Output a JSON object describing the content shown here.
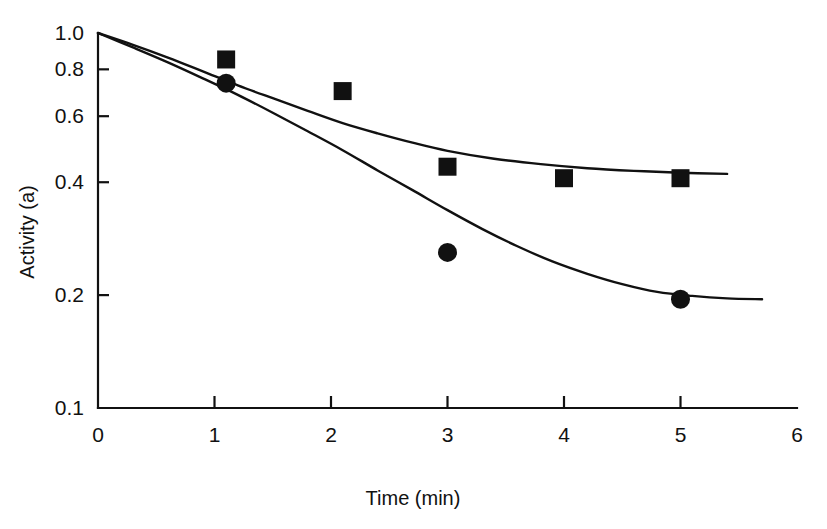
{
  "chart_data": {
    "type": "scatter",
    "title": "",
    "xlabel": "Time (min)",
    "ylabel": "Activity (a)",
    "yscale": "log",
    "xscale": "linear",
    "xlim": [
      0,
      6
    ],
    "ylim": [
      0.1,
      1.0
    ],
    "grid": false,
    "legend": "none",
    "xticks": [
      0,
      1,
      2,
      3,
      4,
      5,
      6
    ],
    "xtick_labels": [
      "0",
      "1",
      "2",
      "3",
      "4",
      "5",
      "6"
    ],
    "yticks": [
      1.0,
      0.8,
      0.6,
      0.4,
      0.2,
      0.1
    ],
    "ytick_labels": [
      "1.0",
      "0.8",
      "0.6",
      "0.4",
      "0.2",
      "0.1"
    ],
    "series": [
      {
        "name": "square-series",
        "marker": "square",
        "points": [
          {
            "x": 1.1,
            "y": 0.85
          },
          {
            "x": 2.1,
            "y": 0.7
          },
          {
            "x": 3.0,
            "y": 0.44
          },
          {
            "x": 4.0,
            "y": 0.41
          },
          {
            "x": 5.0,
            "y": 0.41
          }
        ],
        "fit_curve": [
          {
            "x": 0.0,
            "y": 1.0
          },
          {
            "x": 0.3,
            "y": 0.93
          },
          {
            "x": 0.6,
            "y": 0.86
          },
          {
            "x": 0.9,
            "y": 0.79
          },
          {
            "x": 1.2,
            "y": 0.725
          },
          {
            "x": 1.5,
            "y": 0.67
          },
          {
            "x": 1.8,
            "y": 0.62
          },
          {
            "x": 2.1,
            "y": 0.575
          },
          {
            "x": 2.4,
            "y": 0.54
          },
          {
            "x": 2.7,
            "y": 0.51
          },
          {
            "x": 3.0,
            "y": 0.485
          },
          {
            "x": 3.4,
            "y": 0.462
          },
          {
            "x": 3.8,
            "y": 0.447
          },
          {
            "x": 4.2,
            "y": 0.436
          },
          {
            "x": 4.6,
            "y": 0.429
          },
          {
            "x": 5.0,
            "y": 0.424
          },
          {
            "x": 5.4,
            "y": 0.421
          }
        ]
      },
      {
        "name": "circle-series",
        "marker": "circle",
        "points": [
          {
            "x": 1.1,
            "y": 0.735
          },
          {
            "x": 3.0,
            "y": 0.26
          },
          {
            "x": 5.0,
            "y": 0.195
          }
        ],
        "fit_curve": [
          {
            "x": 0.0,
            "y": 1.0
          },
          {
            "x": 0.3,
            "y": 0.915
          },
          {
            "x": 0.6,
            "y": 0.835
          },
          {
            "x": 0.9,
            "y": 0.757
          },
          {
            "x": 1.2,
            "y": 0.684
          },
          {
            "x": 1.5,
            "y": 0.613
          },
          {
            "x": 1.8,
            "y": 0.547
          },
          {
            "x": 2.1,
            "y": 0.487
          },
          {
            "x": 2.4,
            "y": 0.43
          },
          {
            "x": 2.7,
            "y": 0.381
          },
          {
            "x": 3.0,
            "y": 0.337
          },
          {
            "x": 3.3,
            "y": 0.3
          },
          {
            "x": 3.6,
            "y": 0.27
          },
          {
            "x": 3.9,
            "y": 0.246
          },
          {
            "x": 4.2,
            "y": 0.228
          },
          {
            "x": 4.5,
            "y": 0.214
          },
          {
            "x": 4.8,
            "y": 0.204
          },
          {
            "x": 5.1,
            "y": 0.199
          },
          {
            "x": 5.4,
            "y": 0.196
          },
          {
            "x": 5.7,
            "y": 0.195
          }
        ]
      }
    ]
  },
  "colors": {
    "foreground": "#111111",
    "background": "#ffffff"
  }
}
